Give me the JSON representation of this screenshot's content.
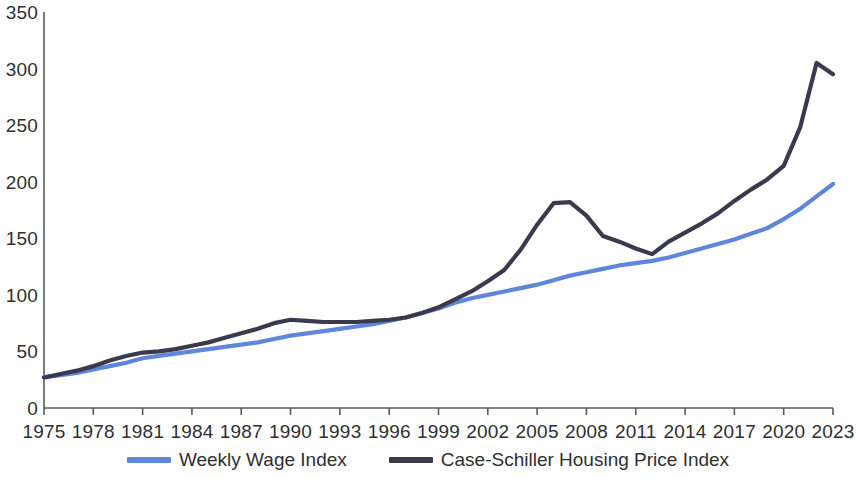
{
  "chart_data": {
    "type": "line",
    "title": "",
    "subtitle": "",
    "xlabel": "",
    "ylabel": "",
    "xlim": [
      1975,
      2023
    ],
    "ylim": [
      0,
      350
    ],
    "grid": false,
    "legend_position": "bottom",
    "y_ticks": [
      0,
      50,
      100,
      150,
      200,
      250,
      300,
      350
    ],
    "y_tick_labels": [
      "0",
      "50",
      "100",
      "150",
      "200",
      "250",
      "300",
      "350"
    ],
    "x_ticks": [
      1975,
      1978,
      1981,
      1984,
      1987,
      1990,
      1993,
      1996,
      1999,
      2002,
      2005,
      2008,
      2011,
      2014,
      2017,
      2020,
      2023
    ],
    "x_tick_labels": [
      "1975",
      "1978",
      "1981",
      "1984",
      "1987",
      "1990",
      "1993",
      "1996",
      "1999",
      "2002",
      "2005",
      "2008",
      "2011",
      "2014",
      "2017",
      "2020",
      "2023"
    ],
    "x": [
      1975,
      1976,
      1977,
      1978,
      1979,
      1980,
      1981,
      1982,
      1983,
      1984,
      1985,
      1986,
      1987,
      1988,
      1989,
      1990,
      1991,
      1992,
      1993,
      1994,
      1995,
      1996,
      1997,
      1998,
      1999,
      2000,
      2001,
      2002,
      2003,
      2004,
      2005,
      2006,
      2007,
      2008,
      2009,
      2010,
      2011,
      2012,
      2013,
      2014,
      2015,
      2016,
      2017,
      2018,
      2019,
      2020,
      2021,
      2022,
      2023
    ],
    "series": [
      {
        "name": "Weekly Wage Index",
        "color": "#5f86dd",
        "values": [
          27,
          29,
          31,
          34,
          37,
          40,
          44,
          46,
          48,
          50,
          52,
          54,
          56,
          58,
          61,
          64,
          66,
          68,
          70,
          72,
          74,
          77,
          80,
          84,
          88,
          93,
          97,
          100,
          103,
          106,
          109,
          113,
          117,
          120,
          123,
          126,
          128,
          130,
          133,
          137,
          141,
          145,
          149,
          154,
          159,
          167,
          176,
          187,
          198
        ]
      },
      {
        "name": "Case-Schiller Housing Price Index",
        "color": "#3a3a4e",
        "values": [
          27,
          30,
          33,
          37,
          42,
          46,
          49,
          50,
          52,
          55,
          58,
          62,
          66,
          70,
          75,
          78,
          77,
          76,
          76,
          76,
          77,
          78,
          80,
          84,
          89,
          96,
          103,
          112,
          122,
          140,
          162,
          181,
          182,
          170,
          152,
          147,
          141,
          136,
          147,
          155,
          163,
          172,
          183,
          193,
          202,
          214,
          248,
          305,
          295
        ]
      }
    ]
  },
  "legend": {
    "items": [
      {
        "label": "Weekly Wage Index",
        "color": "#5f86dd"
      },
      {
        "label": "Case-Schiller Housing Price Index",
        "color": "#3a3a4e"
      }
    ]
  },
  "axis": {
    "line_color": "#595959"
  }
}
